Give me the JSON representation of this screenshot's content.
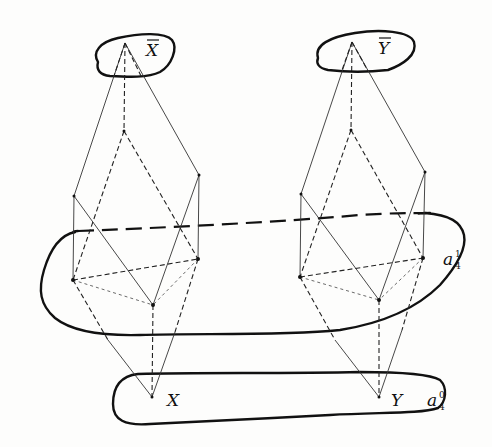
{
  "figure": {
    "type": "mathematical diagram",
    "labels": {
      "x_bar": "X",
      "y_bar": "Y",
      "x": "X",
      "y": "Y",
      "a1_base": "a",
      "a1_sub": "4",
      "a1_sup": "1",
      "a0_base": "a",
      "a0_sub": "4",
      "a0_sup": "0"
    },
    "regions": [
      {
        "name": "X-bar",
        "label": "X̄"
      },
      {
        "name": "Y-bar",
        "label": "Ȳ"
      },
      {
        "name": "a_4^1",
        "label": "a₄¹"
      },
      {
        "name": "a_4^0",
        "label": "a₄⁰"
      }
    ],
    "structures": [
      {
        "name": "left-lattice",
        "top": "X̄",
        "bottom": "X"
      },
      {
        "name": "right-lattice",
        "top": "Ȳ",
        "bottom": "Y"
      }
    ]
  }
}
